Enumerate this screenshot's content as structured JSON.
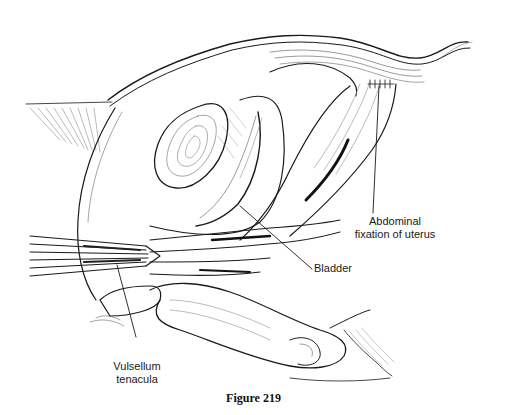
{
  "figure": {
    "caption": "Figure 219",
    "labels": {
      "abdominal_fixation_line1": "Abdominal",
      "abdominal_fixation_line2": "fixation of uterus",
      "bladder": "Bladder",
      "vulsellum_line1": "Vulsellum",
      "vulsellum_line2": "tenacula"
    },
    "colors": {
      "ink": "#1a1a1a",
      "background": "#ffffff"
    }
  }
}
